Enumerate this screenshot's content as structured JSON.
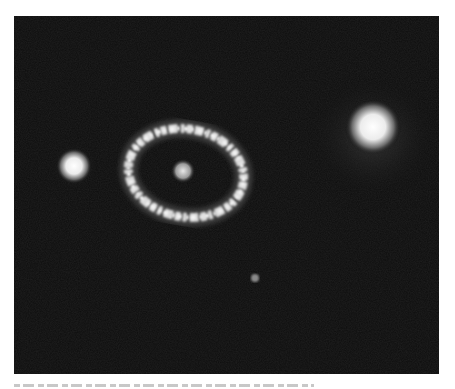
{
  "figure": {
    "objects": [
      {
        "name": "left-star",
        "cx": 74,
        "cy": 166,
        "r": 16
      },
      {
        "name": "ring",
        "cx": 186,
        "cy": 173,
        "rx": 58,
        "ry": 43
      },
      {
        "name": "ring-core",
        "cx": 182,
        "cy": 170,
        "r": 9
      },
      {
        "name": "right-star",
        "cx": 373,
        "cy": 127,
        "r": 24
      },
      {
        "name": "faint-dot",
        "cx": 255,
        "cy": 278,
        "r": 3
      }
    ],
    "colors": {
      "background": "#0d0d0d",
      "star": "#f2f2f2",
      "page": "#ffffff"
    }
  },
  "caption": {
    "visible": "clipped"
  }
}
